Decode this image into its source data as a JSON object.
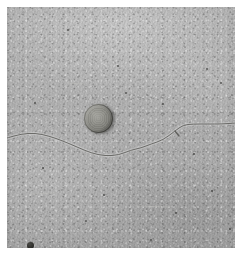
{
  "image": {
    "subject": "concrete-pavement-crack-with-coin-scale",
    "scene_description": "Close-up photograph of a light gray concrete surface with a thin hairline crack running horizontally across the middle, and a round metal coin placed above the crack for scale reference.",
    "orientation": "portrait",
    "width_px": 242,
    "height_px": 255,
    "border": {
      "style": "white-margin",
      "color": "#ffffff",
      "inset_px": 7
    },
    "surface": {
      "name": "concrete",
      "base_color": "#b0b0b0",
      "highlight_color": "#c4c4c4",
      "shadow_color": "#9d9d9d",
      "texture": "fine speckled aggregate grain"
    },
    "crack": {
      "name": "hairline-crack",
      "color": "#6b6b68",
      "stroke_width_px": 1,
      "description": "Single sinuous hairline crack entering at the left edge near mid-height, dipping below center, then rising toward the upper right and continuing nearly horizontally to the right edge.",
      "path_points": [
        [
          0,
          131
        ],
        [
          14,
          127
        ],
        [
          28,
          126
        ],
        [
          42,
          129
        ],
        [
          56,
          134
        ],
        [
          70,
          140
        ],
        [
          84,
          146
        ],
        [
          98,
          149
        ],
        [
          112,
          148
        ],
        [
          124,
          143
        ],
        [
          134,
          141
        ],
        [
          144,
          137
        ],
        [
          156,
          133
        ],
        [
          168,
          124
        ],
        [
          176,
          118
        ],
        [
          186,
          117
        ],
        [
          200,
          117
        ],
        [
          215,
          117
        ],
        [
          229,
          116
        ]
      ],
      "branch_points": [
        [
          168,
          124
        ],
        [
          172,
          129
        ]
      ]
    },
    "coin": {
      "name": "reference-coin",
      "center_px": [
        91,
        111
      ],
      "diameter_px": 29,
      "body_color": "#87877f",
      "rim_shadow_color": "#4a4a46",
      "highlight_color": "#9b9b95",
      "description": "Weathered round coin used as a scale marker, lit from the upper left with a dark shadow along its lower-right rim."
    },
    "pebbles": [
      {
        "name": "dark-pebble",
        "x": 20,
        "y": 235,
        "size": 7
      },
      {
        "name": "dark-pebble",
        "x": 53,
        "y": 247,
        "size": 4
      }
    ],
    "specks": [
      {
        "x": 199,
        "y": 61,
        "size": 2
      },
      {
        "x": 213,
        "y": 75,
        "size": 2
      },
      {
        "x": 60,
        "y": 22,
        "size": 2
      },
      {
        "x": 118,
        "y": 85,
        "size": 2
      },
      {
        "x": 155,
        "y": 96,
        "size": 2
      },
      {
        "x": 35,
        "y": 160,
        "size": 2
      },
      {
        "x": 96,
        "y": 187,
        "size": 2
      },
      {
        "x": 168,
        "y": 205,
        "size": 2
      },
      {
        "x": 204,
        "y": 183,
        "size": 2
      },
      {
        "x": 78,
        "y": 213,
        "size": 2
      },
      {
        "x": 143,
        "y": 232,
        "size": 2
      },
      {
        "x": 27,
        "y": 95,
        "size": 2
      },
      {
        "x": 186,
        "y": 146,
        "size": 2
      },
      {
        "x": 110,
        "y": 58,
        "size": 2
      },
      {
        "x": 222,
        "y": 221,
        "size": 2
      }
    ],
    "scratches": [
      {
        "x": 23,
        "y": 186,
        "width": 26,
        "rotate": -3
      },
      {
        "x": 130,
        "y": 199,
        "width": 34,
        "rotate": 2
      },
      {
        "x": 167,
        "y": 54,
        "width": 20,
        "rotate": -5
      },
      {
        "x": 60,
        "y": 76,
        "width": 18,
        "rotate": 4
      }
    ]
  }
}
